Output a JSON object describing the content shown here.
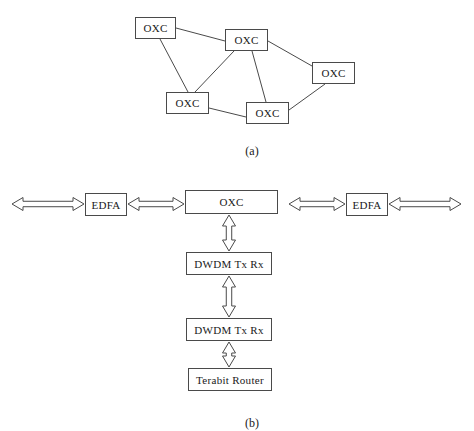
{
  "figure": {
    "background_color": "#ffffff",
    "line_color": "#4a4a4a",
    "text_color": "#1a1a1a",
    "panels": [
      {
        "id": "panel-a",
        "caption": "(a)",
        "caption_x": 252,
        "caption_y": 144,
        "type": "mesh-topology",
        "nodes": [
          {
            "id": "n1",
            "label": "OXC",
            "x": 135,
            "y": 17,
            "w": 41,
            "h": 22
          },
          {
            "id": "n2",
            "label": "OXC",
            "x": 225,
            "y": 29,
            "w": 43,
            "h": 22
          },
          {
            "id": "n3",
            "label": "OXC",
            "x": 312,
            "y": 62,
            "w": 43,
            "h": 22
          },
          {
            "id": "n4",
            "label": "OXC",
            "x": 166,
            "y": 92,
            "w": 43,
            "h": 22
          },
          {
            "id": "n5",
            "label": "OXC",
            "x": 246,
            "y": 102,
            "w": 43,
            "h": 22
          }
        ],
        "edges": [
          {
            "from": "n1",
            "to": "n2",
            "x1": 176,
            "y1": 28,
            "x2": 225,
            "y2": 41
          },
          {
            "from": "n1",
            "to": "n4",
            "x1": 160,
            "y1": 39,
            "x2": 188,
            "y2": 92
          },
          {
            "from": "n2",
            "to": "n3",
            "x1": 268,
            "y1": 41,
            "x2": 312,
            "y2": 66
          },
          {
            "from": "n2",
            "to": "n4",
            "x1": 234,
            "y1": 51,
            "x2": 195,
            "y2": 92
          },
          {
            "from": "n2",
            "to": "n5",
            "x1": 252,
            "y1": 51,
            "x2": 266,
            "y2": 102
          },
          {
            "from": "n4",
            "to": "n5",
            "x1": 209,
            "y1": 108,
            "x2": 246,
            "y2": 117
          },
          {
            "from": "n5",
            "to": "n3",
            "x1": 289,
            "y1": 110,
            "x2": 325,
            "y2": 84
          }
        ]
      },
      {
        "id": "panel-b",
        "caption": "(b)",
        "caption_x": 252,
        "caption_y": 416,
        "type": "node-architecture",
        "nodes": [
          {
            "id": "edfa-left",
            "label": "EDFA",
            "x": 85,
            "y": 193,
            "w": 42,
            "h": 23
          },
          {
            "id": "oxc-center",
            "label": "OXC",
            "x": 185,
            "y": 190,
            "w": 93,
            "h": 24
          },
          {
            "id": "edfa-right",
            "label": "EDFA",
            "x": 346,
            "y": 193,
            "w": 42,
            "h": 23
          },
          {
            "id": "dwdm-upper",
            "label": "DWDM Tx Rx",
            "x": 186,
            "y": 252,
            "w": 86,
            "h": 23
          },
          {
            "id": "dwdm-lower",
            "label": "DWDM Tx Rx",
            "x": 186,
            "y": 318,
            "w": 86,
            "h": 23
          },
          {
            "id": "terabit-router",
            "label": "Terabit Router",
            "x": 188,
            "y": 368,
            "w": 84,
            "h": 23
          }
        ],
        "arrows": [
          {
            "id": "arrow-far-left",
            "orientation": "horizontal",
            "x1": 12,
            "y1": 204,
            "x2": 84,
            "y2": 204,
            "thickness": 13,
            "head": 11,
            "double": true
          },
          {
            "id": "arrow-edfa-left-to-oxc",
            "orientation": "horizontal",
            "x1": 128,
            "y1": 204,
            "x2": 184,
            "y2": 204,
            "thickness": 13,
            "head": 11,
            "double": true
          },
          {
            "id": "arrow-oxc-to-edfa-right",
            "orientation": "horizontal",
            "x1": 289,
            "y1": 204,
            "x2": 345,
            "y2": 204,
            "thickness": 13,
            "head": 11,
            "double": true
          },
          {
            "id": "arrow-far-right",
            "orientation": "horizontal",
            "x1": 389,
            "y1": 204,
            "x2": 461,
            "y2": 204,
            "thickness": 13,
            "head": 11,
            "double": true
          },
          {
            "id": "arrow-oxc-to-dwdm-upper",
            "orientation": "vertical",
            "x1": 229,
            "y1": 215,
            "x2": 229,
            "y2": 251,
            "thickness": 13,
            "head": 11,
            "double": true
          },
          {
            "id": "arrow-dwdm-upper-to-lower",
            "orientation": "vertical",
            "x1": 229,
            "y1": 276,
            "x2": 229,
            "y2": 317,
            "thickness": 13,
            "head": 11,
            "double": true
          },
          {
            "id": "arrow-router-to-dwdm-lower",
            "orientation": "vertical",
            "x1": 229,
            "y1": 342,
            "x2": 229,
            "y2": 367,
            "thickness": 13,
            "head": 11,
            "double": true
          }
        ]
      }
    ]
  }
}
